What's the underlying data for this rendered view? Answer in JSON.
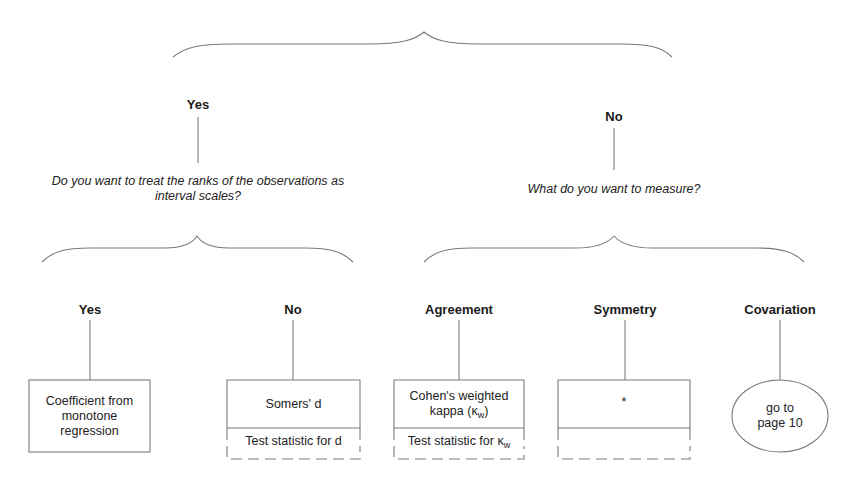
{
  "top": {
    "branches": [
      {
        "label": "Yes",
        "question_line1": "Do you want to treat the ranks of the observations as",
        "question_line2": "interval scales?"
      },
      {
        "label": "No",
        "question_line1": "What do you want to measure?"
      }
    ]
  },
  "leaves": [
    {
      "label": "Yes",
      "box_text": [
        "Coefficient from",
        "monotone",
        "regression"
      ],
      "shape": "box"
    },
    {
      "label": "No",
      "box_text": [
        "Somers' d"
      ],
      "test_text": "Test statistic for d",
      "shape": "split-box"
    },
    {
      "label": "Agreement",
      "box_text": [
        "Cohen's weighted",
        "kappa (κ"
      ],
      "box_sub": "w",
      "box_suffix": ")",
      "test_text": "Test statistic for κ",
      "test_sub": "w",
      "shape": "split-box"
    },
    {
      "label": "Symmetry",
      "box_text": [
        "*"
      ],
      "test_text": "",
      "shape": "split-box"
    },
    {
      "label": "Covariation",
      "box_text": [
        "go to",
        "page 10"
      ],
      "shape": "ellipse"
    }
  ],
  "colors": {
    "line": "#7a7a7a",
    "text": "#1a1a1a"
  }
}
